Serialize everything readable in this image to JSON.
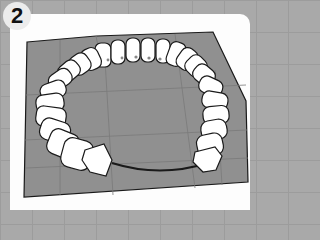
{
  "panel": {
    "step_number": "2",
    "description": "Ring of white rounded tiles arranged on a gray cutting mat with a dark cord joining the ends",
    "colors": {
      "background": "#a9a9a9",
      "card": "#fdfdfd",
      "badge": "#ececec",
      "mat": "#8f8f8f",
      "tile": "#ffffff",
      "outline": "#1a1a1a"
    }
  }
}
